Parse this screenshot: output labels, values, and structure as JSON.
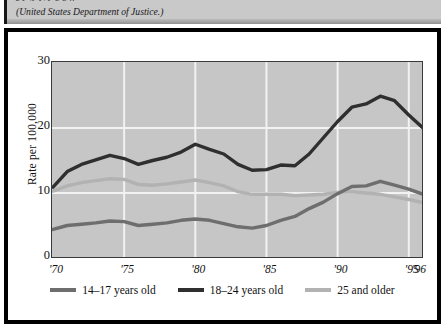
{
  "caption": {
    "line1": "g y                 ,p                     y,    y    g          g           ff                ",
    "line2": "(United States Department of Justice.)"
  },
  "chart_data": {
    "type": "line",
    "title": "",
    "xlabel": "",
    "ylabel": "Rate per 100,000",
    "xlim": [
      1970,
      1996
    ],
    "ylim": [
      0,
      30
    ],
    "yticks": [
      0,
      10,
      20,
      30
    ],
    "ytick_labels": [
      "0",
      "10",
      "20",
      "30"
    ],
    "xticks": [
      1970,
      1975,
      1980,
      1985,
      1990,
      1995,
      1996
    ],
    "xtick_labels": [
      "'70",
      "'75",
      "'80",
      "'85",
      "'90",
      "'95",
      "'96"
    ],
    "grid": true,
    "grid_color": "#f2f2f2",
    "plot_background": "#c6c6c6",
    "legend_position": "bottom",
    "x": [
      1970,
      1971,
      1972,
      1973,
      1974,
      1975,
      1976,
      1977,
      1978,
      1979,
      1980,
      1981,
      1982,
      1983,
      1984,
      1985,
      1986,
      1987,
      1988,
      1989,
      1990,
      1991,
      1992,
      1993,
      1994,
      1995,
      1996
    ],
    "series": [
      {
        "name": "14–17 years old",
        "color": "#6e6e6e",
        "values": [
          4.4,
          5.0,
          5.2,
          5.4,
          5.7,
          5.6,
          5.0,
          5.2,
          5.4,
          5.8,
          6.0,
          5.8,
          5.3,
          4.8,
          4.6,
          5.0,
          5.8,
          6.4,
          7.6,
          8.6,
          9.9,
          11.0,
          11.1,
          11.8,
          11.2,
          10.6,
          9.8
        ]
      },
      {
        "name": "18–24 years old",
        "color": "#2f2f2f",
        "values": [
          10.9,
          13.3,
          14.4,
          15.1,
          15.8,
          15.3,
          14.4,
          15.0,
          15.5,
          16.3,
          17.5,
          16.7,
          16.0,
          14.4,
          13.5,
          13.6,
          14.3,
          14.2,
          16.0,
          18.5,
          21.0,
          23.2,
          23.7,
          24.9,
          24.2,
          22.0,
          20.0
        ]
      },
      {
        "name": "25 and older",
        "color": "#b2b2b2",
        "values": [
          10.3,
          11.1,
          11.6,
          11.9,
          12.2,
          12.1,
          11.3,
          11.2,
          11.4,
          11.7,
          12.0,
          11.6,
          11.1,
          10.2,
          9.8,
          9.8,
          9.8,
          9.6,
          9.7,
          9.8,
          10.1,
          10.2,
          10.0,
          9.8,
          9.4,
          9.0,
          8.5
        ]
      }
    ],
    "legend": [
      {
        "label": "14–17 years old",
        "color": "#6e6e6e"
      },
      {
        "label": "18–24 years old",
        "color": "#2f2f2f"
      },
      {
        "label": "25 and older",
        "color": "#b2b2b2"
      }
    ]
  }
}
